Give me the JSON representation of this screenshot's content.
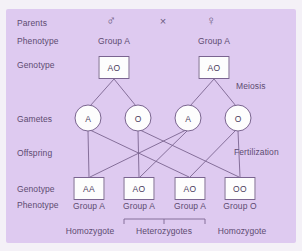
{
  "diagram": {
    "background_color": "#decaf0",
    "text_color": "#5d4b70",
    "node_fill": "#fdfdfd",
    "node_stroke": "#7a6490"
  },
  "row_labels": {
    "parents": "Parents",
    "phenotype_top": "Phenotype",
    "genotype_top": "Genotype",
    "gametes": "Gametes",
    "offspring": "Offspring",
    "genotype_bottom": "Genotype",
    "phenotype_bottom": "Phenotype"
  },
  "parents": {
    "male_symbol": "♂",
    "cross_symbol": "×",
    "female_symbol": "♀",
    "phenotypes": [
      "Group A",
      "Group A"
    ],
    "genotypes": [
      "AO",
      "AO"
    ]
  },
  "process_labels": {
    "meiosis": "Meiosis",
    "fertilization": "Fertilization"
  },
  "gametes": [
    "A",
    "O",
    "A",
    "O"
  ],
  "offspring": {
    "genotypes": [
      "AA",
      "AO",
      "AO",
      "OO"
    ],
    "phenotypes": [
      "Group A",
      "Group A",
      "Group A",
      "Group O"
    ]
  },
  "zygosity": {
    "left": "Homozygote",
    "middle": "Heterozygotes",
    "right": "Homozygote"
  }
}
